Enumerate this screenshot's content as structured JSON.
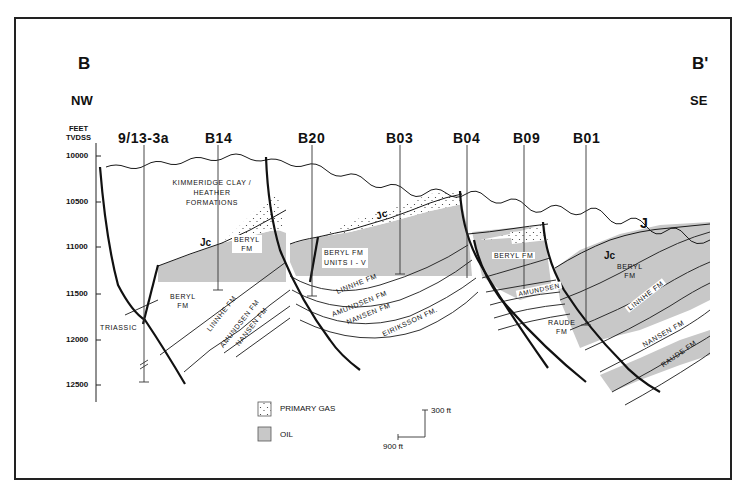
{
  "section": {
    "start_label": "B",
    "end_label": "B'",
    "start_direction": "NW",
    "end_direction": "SE"
  },
  "axis": {
    "title_line1": "FEET",
    "title_line2": "TVDSS",
    "ticks": [
      "10000",
      "10500",
      "11000",
      "11500",
      "12000",
      "12500"
    ]
  },
  "wells": [
    {
      "name": "9/13-3a"
    },
    {
      "name": "B14"
    },
    {
      "name": "B20"
    },
    {
      "name": "B03"
    },
    {
      "name": "B04"
    },
    {
      "name": "B09"
    },
    {
      "name": "B01"
    }
  ],
  "formations": {
    "kimmeridge_line1": "KIMMERIDGE CLAY /",
    "kimmeridge_line2": "HEATHER",
    "kimmeridge_line3": "FORMATIONS",
    "triassic": "TRIASSIC",
    "beryl_fm": "BERYL",
    "fm": "FM",
    "beryl_units_line1": "BERYL FM",
    "beryl_units_line2": "UNITS I - V",
    "beryl_fm_full": "BERYL FM",
    "linnhe": "LINNHE FM",
    "amundsen": "AMUNDSEN FM",
    "amundsen_short": "AMUNDSEN",
    "nansen": "NANSEN FM",
    "eiriksson": "EIRIKSSON FM.",
    "raude_line1": "RAUDE",
    "raude_line2": "FM",
    "raude": "RAUDE FM",
    "jc": "Jc",
    "j": "J"
  },
  "legend": {
    "gas_label": "PRIMARY GAS",
    "oil_label": "OIL"
  },
  "scale": {
    "vertical": "300 ft",
    "horizontal": "900 ft"
  },
  "colors": {
    "oil": "#c8c8c8",
    "line": "#1a1a1a",
    "border": "#222222"
  }
}
